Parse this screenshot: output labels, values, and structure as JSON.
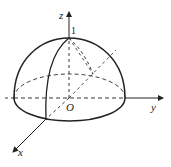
{
  "diagram": {
    "labels": {
      "z_axis": "z",
      "y_axis": "y",
      "x_axis": "x",
      "origin": "O",
      "top_value": "1"
    },
    "colors": {
      "stroke": "#222222",
      "background": "#ffffff"
    }
  }
}
